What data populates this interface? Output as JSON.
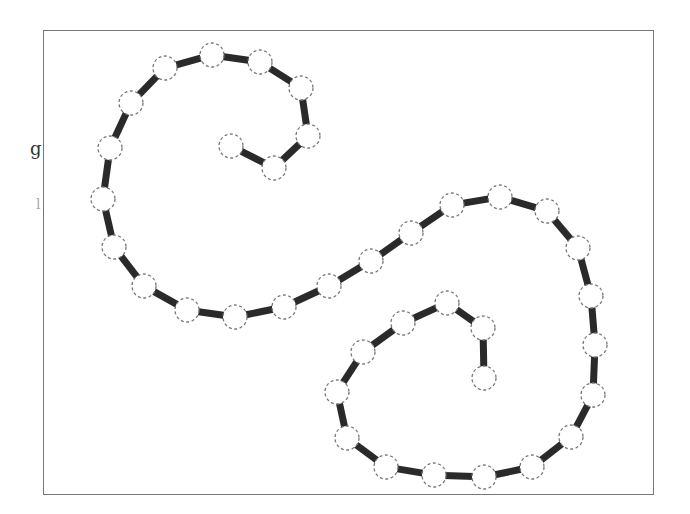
{
  "side_labels": {
    "top": "g",
    "bottom": "l"
  },
  "style": {
    "line_color": "#2a2a2a",
    "line_width": 7,
    "node_fill": "#ffffff",
    "node_stroke": "#777777",
    "node_radius": 12,
    "frame_color": "#777777"
  },
  "diagram": {
    "type": "chain-of-nodes",
    "nodes": [
      [
        231,
        146
      ],
      [
        274,
        168
      ],
      [
        308,
        136
      ],
      [
        301,
        88
      ],
      [
        260,
        62
      ],
      [
        212,
        55
      ],
      [
        165,
        68
      ],
      [
        131,
        103
      ],
      [
        110,
        148
      ],
      [
        103,
        199
      ],
      [
        114,
        247
      ],
      [
        144,
        286
      ],
      [
        187,
        310
      ],
      [
        235,
        317
      ],
      [
        284,
        307
      ],
      [
        329,
        286
      ],
      [
        371,
        261
      ],
      [
        411,
        233
      ],
      [
        452,
        205
      ],
      [
        500,
        197
      ],
      [
        547,
        211
      ],
      [
        578,
        248
      ],
      [
        591,
        296
      ],
      [
        595,
        345
      ],
      [
        593,
        395
      ],
      [
        571,
        437
      ],
      [
        532,
        467
      ],
      [
        484,
        477
      ],
      [
        434,
        475
      ],
      [
        386,
        467
      ],
      [
        347,
        438
      ],
      [
        337,
        392
      ],
      [
        363,
        352
      ],
      [
        403,
        323
      ],
      [
        447,
        303
      ],
      [
        483,
        328
      ],
      [
        484,
        378
      ]
    ]
  }
}
